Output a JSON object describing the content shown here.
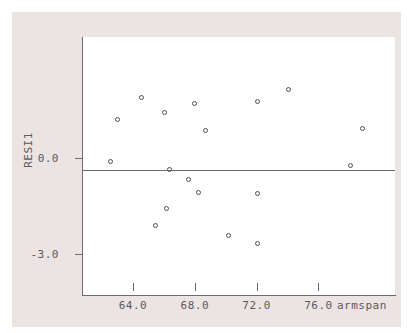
{
  "chart_data": {
    "type": "scatter",
    "title": "",
    "xlabel": "armspan",
    "ylabel": "RESI1",
    "xlim": [
      61.2,
      81.5
    ],
    "ylim": [
      -3.9,
      4.2
    ],
    "grid": false,
    "legend": null,
    "reference_lines": [
      {
        "axis": "y",
        "value": 0.0,
        "label": "0.0"
      }
    ],
    "xticks": [
      {
        "value": 64.0,
        "label": "64.0"
      },
      {
        "value": 68.0,
        "label": "68.0"
      },
      {
        "value": 72.0,
        "label": "72.0"
      },
      {
        "value": 76.0,
        "label": "76.0"
      }
    ],
    "yticks": [
      {
        "value": 0.0,
        "label": "0.0"
      },
      {
        "value": -3.0,
        "label": "-3.0"
      }
    ],
    "marker": "open-circle",
    "marker_color": "#4e4e56",
    "points": [
      {
        "x": 64.6,
        "y": 1.88
      },
      {
        "x": 63.0,
        "y": 1.19
      },
      {
        "x": 62.6,
        "y": -0.13
      },
      {
        "x": 66.1,
        "y": 1.41
      },
      {
        "x": 68.0,
        "y": 1.69
      },
      {
        "x": 68.7,
        "y": 0.84
      },
      {
        "x": 66.4,
        "y": -0.38
      },
      {
        "x": 67.6,
        "y": -0.69
      },
      {
        "x": 68.3,
        "y": -1.09
      },
      {
        "x": 66.2,
        "y": -1.59
      },
      {
        "x": 65.5,
        "y": -2.13
      },
      {
        "x": 70.2,
        "y": -2.44
      },
      {
        "x": 72.1,
        "y": -2.69
      },
      {
        "x": 72.1,
        "y": -1.13
      },
      {
        "x": 72.1,
        "y": 1.75
      },
      {
        "x": 74.1,
        "y": 2.13
      },
      {
        "x": 78.9,
        "y": 0.91
      },
      {
        "x": 78.1,
        "y": -0.25
      }
    ]
  },
  "colors": {
    "panel_background": "#ece4e2",
    "plot_background": "#ffffff",
    "axis": "#6b6b6b",
    "text": "#5a5a5a",
    "marker": "#4e4e56"
  }
}
